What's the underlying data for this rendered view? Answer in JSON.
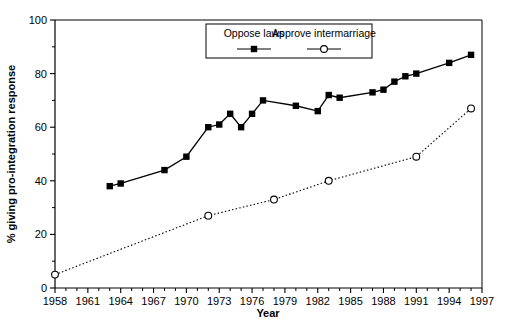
{
  "chart_data": {
    "type": "line",
    "title": "",
    "xlabel": "Year",
    "ylabel": "% giving pro-integration response",
    "xlim": [
      1958,
      1997
    ],
    "ylim": [
      0,
      100
    ],
    "grid": false,
    "legend_position": "top-center",
    "x_ticks": [
      1958,
      1961,
      1964,
      1967,
      1970,
      1973,
      1976,
      1979,
      1982,
      1985,
      1988,
      1991,
      1994,
      1997
    ],
    "x_tick_labels": [
      "1958",
      "1961",
      "1964",
      "1967",
      "1970",
      "1973",
      "1976",
      "1979",
      "1982",
      "1985",
      "1988",
      "1991",
      "1994",
      "1997"
    ],
    "x_minor_tick_step": 1,
    "y_ticks": [
      0,
      20,
      40,
      60,
      80,
      100
    ],
    "y_tick_labels": [
      "0",
      "20",
      "40",
      "60",
      "80",
      "100"
    ],
    "y_minor_tick_step": 10,
    "series": [
      {
        "name": "Oppose laws",
        "marker": "filled-square",
        "line_style": "solid",
        "color": "#000000",
        "points": [
          {
            "x": 1963,
            "y": 38
          },
          {
            "x": 1964,
            "y": 39
          },
          {
            "x": 1968,
            "y": 44
          },
          {
            "x": 1970,
            "y": 49
          },
          {
            "x": 1972,
            "y": 60
          },
          {
            "x": 1973,
            "y": 61
          },
          {
            "x": 1974,
            "y": 65
          },
          {
            "x": 1975,
            "y": 60
          },
          {
            "x": 1976,
            "y": 65
          },
          {
            "x": 1977,
            "y": 70
          },
          {
            "x": 1980,
            "y": 68
          },
          {
            "x": 1982,
            "y": 66
          },
          {
            "x": 1983,
            "y": 72
          },
          {
            "x": 1984,
            "y": 71
          },
          {
            "x": 1987,
            "y": 73
          },
          {
            "x": 1988,
            "y": 74
          },
          {
            "x": 1989,
            "y": 77
          },
          {
            "x": 1990,
            "y": 79
          },
          {
            "x": 1991,
            "y": 80
          },
          {
            "x": 1994,
            "y": 84
          },
          {
            "x": 1996,
            "y": 87
          }
        ]
      },
      {
        "name": "Approve intermarriage",
        "marker": "open-circle",
        "line_style": "dotted",
        "color": "#000000",
        "points": [
          {
            "x": 1958,
            "y": 5
          },
          {
            "x": 1972,
            "y": 27
          },
          {
            "x": 1978,
            "y": 33
          },
          {
            "x": 1983,
            "y": 40
          },
          {
            "x": 1991,
            "y": 49
          },
          {
            "x": 1996,
            "y": 67
          }
        ]
      }
    ]
  },
  "legend": {
    "entries": [
      {
        "label": "Oppose laws",
        "marker": "filled-square"
      },
      {
        "label": "Approve intermarriage",
        "marker": "open-circle"
      }
    ]
  }
}
